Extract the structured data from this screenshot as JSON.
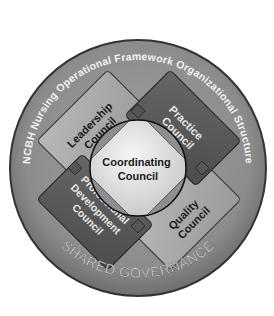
{
  "diagram": {
    "ring_title": "NCBH Nursing Operational Framework Organizational Structure",
    "ring_footer": "SHARED GOVERNANCE",
    "center": {
      "line1": "Coordinating",
      "line2": "Council"
    },
    "councils": {
      "leadership": {
        "line1": "Leadership",
        "line2": "Council"
      },
      "practice": {
        "line1": "Practice",
        "line2": "Council"
      },
      "professional_development": {
        "line1": "Professional",
        "line2": "Development",
        "line3": "Council"
      },
      "quality": {
        "line1": "Quality",
        "line2": "Council"
      }
    },
    "colors": {
      "ring": "#8a8a8a",
      "ring_edge": "#3a3a3a",
      "light_box": "#a9a9a9",
      "dark_box": "#5a5a5a",
      "center_fill": "#e6e6e6",
      "ring_text": "#f2f2f2",
      "dark_text": "#1a1a1a"
    }
  }
}
